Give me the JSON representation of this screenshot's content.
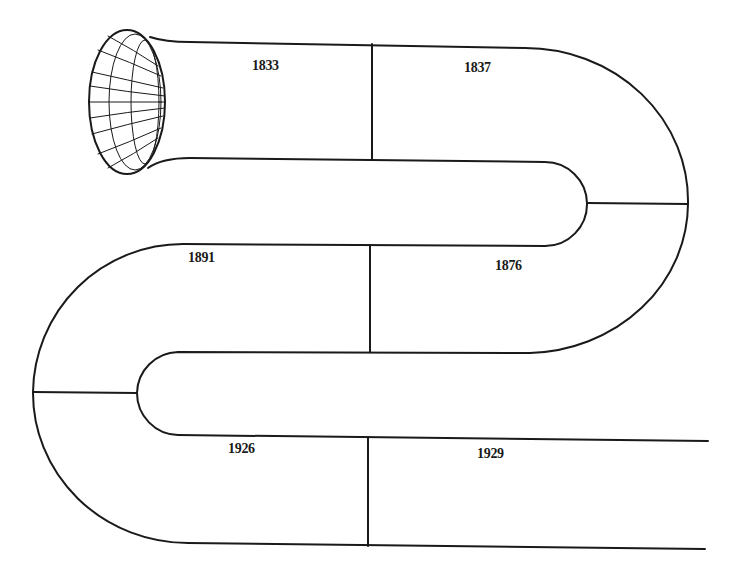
{
  "diagram": {
    "type": "serpentine-tube-timeline",
    "stroke_color": "#1a1a1a",
    "background": "#ffffff",
    "start_icon": "bell-horn-mouth",
    "segments": [
      {
        "label": "1833",
        "x": 252,
        "y": 60
      },
      {
        "label": "1837",
        "x": 465,
        "y": 60
      },
      {
        "label": "1876",
        "x": 495,
        "y": 258
      },
      {
        "label": "1891",
        "x": 188,
        "y": 250
      },
      {
        "label": "1926",
        "x": 228,
        "y": 441
      },
      {
        "label": "1929",
        "x": 477,
        "y": 446
      }
    ]
  }
}
